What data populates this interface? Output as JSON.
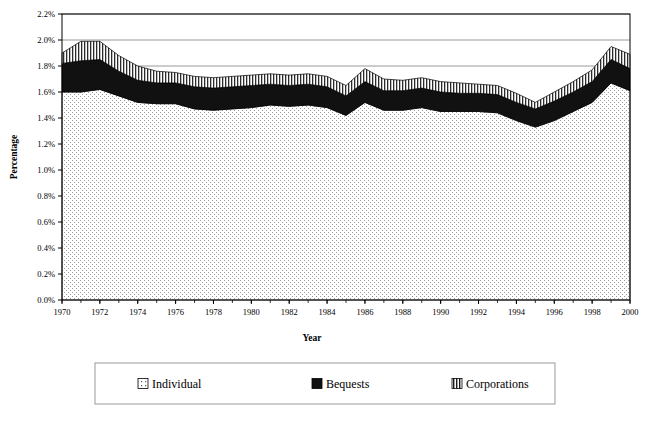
{
  "chart_data": {
    "type": "area",
    "stacked": true,
    "title": "",
    "xlabel": "Year",
    "ylabel": "Percentage",
    "x": [
      1970,
      1971,
      1972,
      1973,
      1974,
      1975,
      1976,
      1977,
      1978,
      1979,
      1980,
      1981,
      1982,
      1983,
      1984,
      1985,
      1986,
      1987,
      1988,
      1989,
      1990,
      1991,
      1992,
      1993,
      1994,
      1995,
      1996,
      1997,
      1998,
      1999,
      2000
    ],
    "xlim": [
      1970,
      2000
    ],
    "ylim": [
      0.0,
      2.2
    ],
    "ytick_labels": [
      "0.0%",
      "0.2%",
      "0.4%",
      "0.6%",
      "0.8%",
      "1.0%",
      "1.2%",
      "1.4%",
      "1.6%",
      "1.8%",
      "2.0%",
      "2.2%"
    ],
    "ytick_values": [
      0.0,
      0.2,
      0.4,
      0.6,
      0.8,
      1.0,
      1.2,
      1.4,
      1.6,
      1.8,
      2.0,
      2.2
    ],
    "xtick_labels": [
      "1970",
      "1972",
      "1974",
      "1976",
      "1978",
      "1980",
      "1982",
      "1984",
      "1986",
      "1988",
      "1990",
      "1992",
      "1994",
      "1996",
      "1998",
      "2000"
    ],
    "xtick_values": [
      1970,
      1972,
      1974,
      1976,
      1978,
      1980,
      1982,
      1984,
      1986,
      1988,
      1990,
      1992,
      1994,
      1996,
      1998,
      2000
    ],
    "gridlines": [
      1.8,
      2.0,
      2.2
    ],
    "grid": true,
    "legend_position": "bottom",
    "series": [
      {
        "name": "Individual",
        "fill": "dotted",
        "color": "#f2f2f2",
        "values": [
          1.6,
          1.6,
          1.62,
          1.57,
          1.52,
          1.51,
          1.51,
          1.47,
          1.46,
          1.47,
          1.48,
          1.5,
          1.49,
          1.5,
          1.48,
          1.42,
          1.52,
          1.46,
          1.46,
          1.48,
          1.45,
          1.45,
          1.45,
          1.44,
          1.38,
          1.33,
          1.38,
          1.45,
          1.52,
          1.67,
          1.61
        ]
      },
      {
        "name": "Bequests",
        "fill": "solid",
        "color": "#111111",
        "values": [
          0.22,
          0.24,
          0.23,
          0.19,
          0.17,
          0.16,
          0.16,
          0.17,
          0.17,
          0.17,
          0.17,
          0.16,
          0.16,
          0.16,
          0.16,
          0.15,
          0.16,
          0.15,
          0.15,
          0.15,
          0.15,
          0.14,
          0.14,
          0.14,
          0.14,
          0.14,
          0.15,
          0.15,
          0.16,
          0.18,
          0.17
        ]
      },
      {
        "name": "Corporations",
        "fill": "vertical-stripes",
        "color": "#808080",
        "values": [
          0.08,
          0.15,
          0.14,
          0.12,
          0.11,
          0.09,
          0.08,
          0.08,
          0.08,
          0.08,
          0.08,
          0.08,
          0.08,
          0.08,
          0.08,
          0.08,
          0.1,
          0.09,
          0.08,
          0.08,
          0.08,
          0.08,
          0.07,
          0.07,
          0.07,
          0.05,
          0.07,
          0.08,
          0.09,
          0.1,
          0.11
        ]
      }
    ]
  },
  "legend": {
    "items": [
      {
        "label": "Individual",
        "swatch": "dotted"
      },
      {
        "label": "Bequests",
        "swatch": "solid"
      },
      {
        "label": "Corporations",
        "swatch": "vertical-stripes"
      }
    ]
  },
  "colors": {
    "individual": "#f2f2f2",
    "bequests": "#111111",
    "corporations": "#808080",
    "axis": "#000000",
    "grid": "#808080",
    "background": "#ffffff"
  }
}
